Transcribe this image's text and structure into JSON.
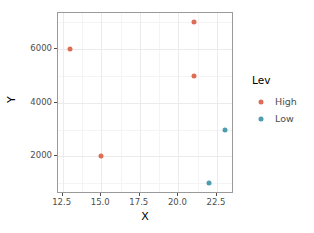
{
  "chart_data": {
    "type": "scatter",
    "title": "",
    "xlabel": "X",
    "ylabel": "Y",
    "xlim": [
      12.2,
      23.6
    ],
    "ylim": [
      600,
      7350
    ],
    "grid": true,
    "legend_position": "right",
    "legend_title": "Lev",
    "x_ticks": [
      12.5,
      15.0,
      17.5,
      20.0,
      22.5
    ],
    "x_ticklabels": [
      "12.5",
      "15.0",
      "17.5",
      "20.0",
      "22.5"
    ],
    "x_minor_ticks": [
      13.75,
      16.25,
      18.75,
      21.25
    ],
    "y_ticks": [
      2000,
      4000,
      6000
    ],
    "y_ticklabels": [
      "2000",
      "4000",
      "6000"
    ],
    "y_minor_ticks": [
      1000,
      3000,
      5000,
      7000
    ],
    "colors": {
      "High": "#df6d56",
      "Low": "#4d9dae",
      "panel_border": "#9a9a9a",
      "grid_major": "#ebebeb",
      "grid_minor": "#f4f4f4",
      "background": "#ffffff",
      "text": "#4d4d4d"
    },
    "series": [
      {
        "name": "High",
        "color": "#df6d56",
        "points": [
          {
            "x": 13,
            "y": 6000
          },
          {
            "x": 15,
            "y": 2000
          },
          {
            "x": 21,
            "y": 7000
          },
          {
            "x": 21,
            "y": 5000
          }
        ]
      },
      {
        "name": "Low",
        "color": "#4d9dae",
        "points": [
          {
            "x": 22,
            "y": 1000
          },
          {
            "x": 23,
            "y": 3000
          }
        ]
      }
    ]
  },
  "legend": {
    "title": "Lev",
    "entries": [
      {
        "label": "High",
        "color": "#df6d56"
      },
      {
        "label": "Low",
        "color": "#4d9dae"
      }
    ]
  },
  "axes": {
    "x_title": "X",
    "y_title": "Y"
  }
}
